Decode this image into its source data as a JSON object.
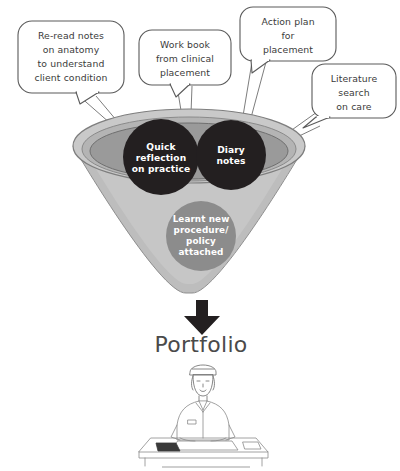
{
  "diagram": {
    "title_label": "Portfolio",
    "bubbles": [
      {
        "name": "re-read-notes",
        "lines": [
          "Re-read notes",
          "on anatomy",
          "to understand",
          "client condition"
        ]
      },
      {
        "name": "work-book",
        "lines": [
          "Work book",
          "from clinical",
          "placement"
        ]
      },
      {
        "name": "action-plan",
        "lines": [
          "Action plan",
          "for",
          "placement"
        ]
      },
      {
        "name": "literature-search",
        "lines": [
          "Literature",
          "search",
          "on care"
        ]
      }
    ],
    "funnel_items": [
      {
        "name": "quick-reflection",
        "lines": [
          "Quick",
          "reflection",
          "on practice"
        ],
        "color": "#231f20"
      },
      {
        "name": "diary-notes",
        "lines": [
          "Diary",
          "notes"
        ],
        "color": "#231f20"
      },
      {
        "name": "learnt-new-procedure",
        "lines": [
          "Learnt new",
          "procedure/",
          "policy",
          "attached"
        ],
        "color": "#8c8c8c"
      }
    ],
    "figure_caption": "",
    "colors": {
      "funnel_outer": "#c9c9c9",
      "funnel_basin": "#9a9a9a",
      "funnel_body": "#bdbdbd",
      "dark_circle": "#231f20",
      "gray_circle": "#8c8c8c",
      "arrow": "#231f20",
      "text_dark": "#3b3b3b",
      "portfolio": "#4a4a4a",
      "bubble_stroke": "#5a5a5a",
      "background": "#ffffff"
    }
  }
}
